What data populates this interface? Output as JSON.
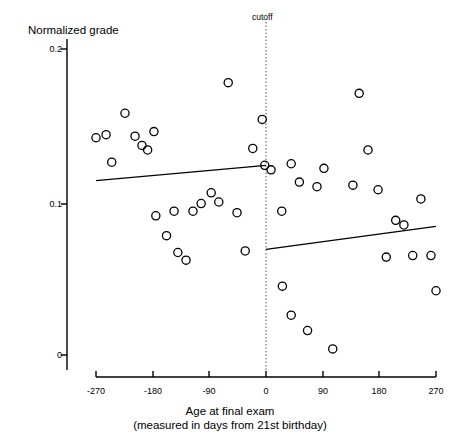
{
  "chart_data": {
    "type": "scatter",
    "title": "",
    "ylabel": "Normalized grade",
    "xlabel_line1": "Age at final exam",
    "xlabel_line2": "(measured in days from 21st birthday)",
    "xlim": [
      -270,
      270
    ],
    "ylim": [
      0,
      0.2
    ],
    "xticks": [
      -270,
      -180,
      -90,
      0,
      90,
      180,
      270
    ],
    "xtick_labels": [
      "-270",
      "-180",
      "-90",
      "0",
      "90",
      "180",
      "270"
    ],
    "yticks": [
      0,
      0.1,
      0.2
    ],
    "ytick_labels": [
      "0",
      "0.1",
      "0.2"
    ],
    "grid": false,
    "legend": "none",
    "annotations": [
      {
        "name": "cutoff",
        "label": "cutoff",
        "x": 0,
        "style": "dotted-vertical-line"
      }
    ],
    "marker": "open-circle",
    "points": [
      {
        "x": -270,
        "y": 0.142
      },
      {
        "x": -254,
        "y": 0.144
      },
      {
        "x": -245,
        "y": 0.126
      },
      {
        "x": -224,
        "y": 0.158
      },
      {
        "x": -208,
        "y": 0.143
      },
      {
        "x": -197,
        "y": 0.137
      },
      {
        "x": -188,
        "y": 0.134
      },
      {
        "x": -178,
        "y": 0.146
      },
      {
        "x": -175,
        "y": 0.091
      },
      {
        "x": -158,
        "y": 0.078
      },
      {
        "x": -146,
        "y": 0.094
      },
      {
        "x": -140,
        "y": 0.067
      },
      {
        "x": -127,
        "y": 0.062
      },
      {
        "x": -116,
        "y": 0.094
      },
      {
        "x": -103,
        "y": 0.099
      },
      {
        "x": -87,
        "y": 0.106
      },
      {
        "x": -75,
        "y": 0.1
      },
      {
        "x": -60,
        "y": 0.178
      },
      {
        "x": -46,
        "y": 0.093
      },
      {
        "x": -33,
        "y": 0.068
      },
      {
        "x": -21,
        "y": 0.135
      },
      {
        "x": -6,
        "y": 0.154
      },
      {
        "x": -2,
        "y": 0.124
      },
      {
        "x": 8,
        "y": 0.121
      },
      {
        "x": 40,
        "y": 0.125
      },
      {
        "x": 25,
        "y": 0.094
      },
      {
        "x": 26,
        "y": 0.045
      },
      {
        "x": 40,
        "y": 0.026
      },
      {
        "x": 53,
        "y": 0.113
      },
      {
        "x": 66,
        "y": 0.016
      },
      {
        "x": 92,
        "y": 0.122
      },
      {
        "x": 81,
        "y": 0.11
      },
      {
        "x": 106,
        "y": 0.004
      },
      {
        "x": 148,
        "y": 0.171
      },
      {
        "x": 162,
        "y": 0.134
      },
      {
        "x": 138,
        "y": 0.111
      },
      {
        "x": 178,
        "y": 0.108
      },
      {
        "x": 191,
        "y": 0.064
      },
      {
        "x": 206,
        "y": 0.088
      },
      {
        "x": 219,
        "y": 0.085
      },
      {
        "x": 233,
        "y": 0.065
      },
      {
        "x": 246,
        "y": 0.102
      },
      {
        "x": 262,
        "y": 0.065
      },
      {
        "x": 270,
        "y": 0.042
      }
    ],
    "fit_lines": [
      {
        "name": "left-fit",
        "x_start": -270,
        "y_start": 0.114,
        "x_end": 0,
        "y_end": 0.124
      },
      {
        "name": "right-fit",
        "x_start": 0,
        "y_start": 0.069,
        "x_end": 270,
        "y_end": 0.084
      }
    ]
  }
}
